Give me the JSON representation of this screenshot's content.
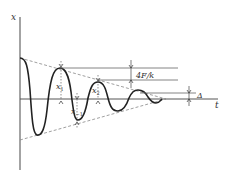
{
  "diagram": {
    "axes": {
      "y_label": "x",
      "x_label": "t"
    },
    "labels": {
      "x1": "x",
      "x1_sub": "1",
      "x2": "x",
      "x2_sub": "2",
      "xm1": "x",
      "xm1_sub": "−1",
      "decrement": "4F/k",
      "delta": "Δ"
    },
    "colors": {
      "curve": "#222222",
      "axis": "#555555",
      "envelope": "#888888",
      "guide": "#666666"
    }
  }
}
